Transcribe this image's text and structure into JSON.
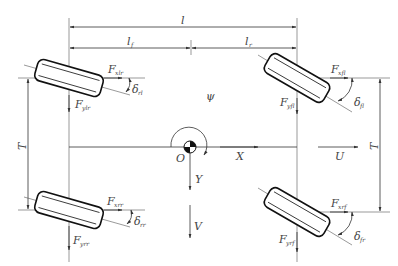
{
  "figure": {
    "type": "vehicle four-wheel planar dynamics model",
    "colors": {
      "line": "#333333",
      "text": "#444444",
      "background": "#ffffff"
    }
  },
  "dimensions": {
    "wheelbase": {
      "symbol": "l",
      "sub": ""
    },
    "front_distance": {
      "symbol": "l",
      "sub": "f"
    },
    "rear_distance": {
      "symbol": "l",
      "sub": "r"
    },
    "front_track": {
      "symbol": "T",
      "sub": "f"
    },
    "rear_track": {
      "symbol": "T",
      "sub": "r"
    }
  },
  "origin": {
    "label": "O",
    "yaw": "ψ",
    "x_axis": "X",
    "y_axis": "Y",
    "long_velocity": "U",
    "lat_velocity": "V"
  },
  "wheels": {
    "front_left": {
      "fx": "F",
      "fx_sub": "xlr",
      "fy": "F",
      "fy_sub": "ylr",
      "delta": "δ",
      "delta_sub": "rl"
    },
    "front_right": {
      "fx": "F",
      "fx_sub": "xfl",
      "fy": "F",
      "fy_sub": "yfl",
      "delta": "δ",
      "delta_sub": "fl"
    },
    "rear_left": {
      "fx": "F",
      "fx_sub": "xrr",
      "fy": "F",
      "fy_sub": "yrr",
      "delta": "δ",
      "delta_sub": "rr"
    },
    "rear_right": {
      "fx": "F",
      "fx_sub": "xrf",
      "fy": "F",
      "fy_sub": "yrf",
      "delta": "δ",
      "delta_sub": "fr"
    }
  }
}
